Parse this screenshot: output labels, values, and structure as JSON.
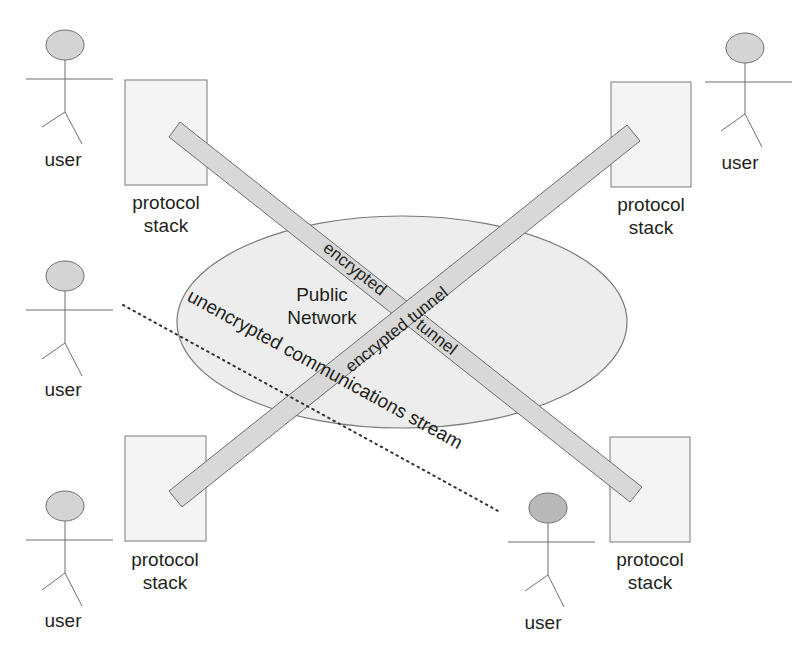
{
  "diagram": {
    "type": "network-tunnel-diagram",
    "network": {
      "label_line1": "Public",
      "label_line2": "Network"
    },
    "users": [
      {
        "id": "user-top-left",
        "label": "user"
      },
      {
        "id": "user-top-right",
        "label": "user"
      },
      {
        "id": "user-middle-left",
        "label": "user"
      },
      {
        "id": "user-bottom-left",
        "label": "user"
      },
      {
        "id": "user-bottom-right",
        "label": "user"
      }
    ],
    "protocol_stacks": [
      {
        "id": "stack-top-left",
        "line1": "protocol",
        "line2": "stack"
      },
      {
        "id": "stack-top-right",
        "line1": "protocol",
        "line2": "stack"
      },
      {
        "id": "stack-bottom-left",
        "line1": "protocol",
        "line2": "stack"
      },
      {
        "id": "stack-bottom-right",
        "line1": "protocol",
        "line2": "stack"
      }
    ],
    "tunnels": [
      {
        "id": "tunnel-tl-br",
        "label_part1": "encrypted",
        "label_part2": "tunnel"
      },
      {
        "id": "tunnel-bl-tr",
        "label": "encrypted tunnel"
      }
    ],
    "stream": {
      "label": "unencrypted communications stream",
      "style": "dotted"
    },
    "colors": {
      "head_fill": "#d4d4d4",
      "head_fill_dark": "#b9b9b9",
      "box_fill": "#f4f4f4",
      "tunnel_fill": "#d8d8d8",
      "network_fill": "#ededed",
      "stroke": "#6e6e6e"
    }
  }
}
